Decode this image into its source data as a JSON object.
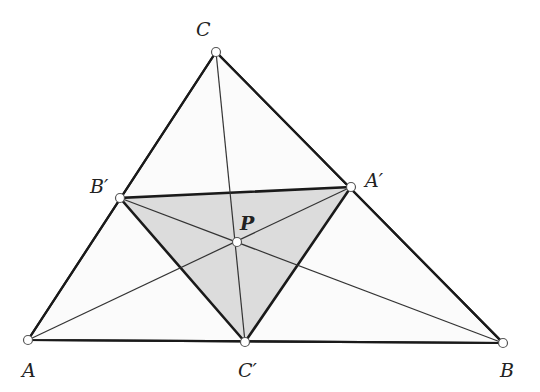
{
  "diagram": {
    "colors": {
      "outer_fill": "#fbfbfb",
      "inner_fill": "#dcdcdc",
      "stroke": "#1a1a1a",
      "point_fill": "#ffffff"
    },
    "points": {
      "A": {
        "label": "A",
        "x": 28,
        "y": 340
      },
      "B": {
        "label": "B",
        "x": 503,
        "y": 343
      },
      "C": {
        "label": "C",
        "x": 216,
        "y": 52
      },
      "A_prime": {
        "label": "A′",
        "x": 351,
        "y": 187
      },
      "B_prime": {
        "label": "B′",
        "x": 120,
        "y": 198
      },
      "C_prime": {
        "label": "C′",
        "x": 245,
        "y": 342
      },
      "P": {
        "label": "P",
        "x": 237,
        "y": 242
      }
    },
    "labels": {
      "A": "A",
      "B": "B",
      "C": "C",
      "A_prime": "A′",
      "B_prime": "B′",
      "C_prime": "C′",
      "P": "P"
    },
    "segments": {
      "outer_triangle": [
        "A",
        "B",
        "C"
      ],
      "cevian_triangle": [
        "A_prime",
        "B_prime",
        "C_prime"
      ],
      "cevians": [
        [
          "A",
          "A_prime"
        ],
        [
          "B",
          "B_prime"
        ],
        [
          "C",
          "C_prime"
        ]
      ]
    }
  }
}
